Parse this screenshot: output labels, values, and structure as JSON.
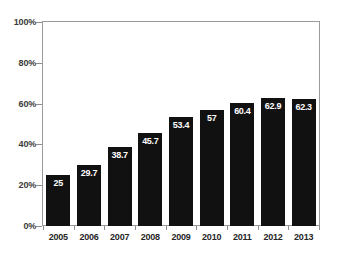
{
  "chart_data": {
    "type": "bar",
    "title": "",
    "subtitle": "",
    "xlabel": "",
    "ylabel": "",
    "categories": [
      "2005",
      "2006",
      "2007",
      "2008",
      "2009",
      "2010",
      "2011",
      "2012",
      "2013"
    ],
    "values": [
      25,
      29.7,
      38.7,
      45.7,
      53.4,
      57,
      60.4,
      62.9,
      62.3
    ],
    "value_labels": [
      "25",
      "29.7",
      "38.7",
      "45.7",
      "53.4",
      "57",
      "60.4",
      "62.9",
      "62.3"
    ],
    "series": [
      {
        "name": "",
        "values": [
          25,
          29.7,
          38.7,
          45.7,
          53.4,
          57,
          60.4,
          62.9,
          62.3
        ]
      }
    ],
    "ylim": [
      0,
      100
    ],
    "ytick_values": [
      0,
      20,
      40,
      60,
      80,
      100
    ],
    "ytick_labels": [
      "0%",
      "20%",
      "40%",
      "60%",
      "80%",
      "100%"
    ],
    "grid": false,
    "legend": "none",
    "annotations": [],
    "colors": {
      "bar_fill": "#111111",
      "value_label": "#ffffff",
      "axis_line": "#9a9a9a",
      "tick_label": "#3a3a3a",
      "category_label": "#262626",
      "background": "#ffffff"
    }
  }
}
